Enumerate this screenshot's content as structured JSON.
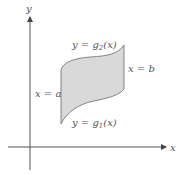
{
  "diagram": {
    "type": "region-between-curves",
    "axes": {
      "x_label": "x",
      "y_label": "y"
    },
    "labels": {
      "top_curve": {
        "prefix": "y = g",
        "subscript": "2",
        "suffix": "(x)"
      },
      "bottom_curve": {
        "prefix": "y = g",
        "subscript": "1",
        "suffix": "(x)"
      },
      "left_bound": "x = a",
      "right_bound": "x = b"
    },
    "colors": {
      "fill": "#d9d9d9",
      "stroke": "#6b6b6b",
      "axis": "#555555"
    }
  }
}
